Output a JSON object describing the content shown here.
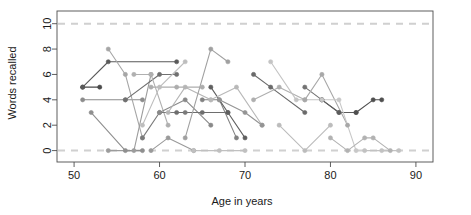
{
  "chart_data": {
    "type": "line",
    "title": "",
    "subtitle": "",
    "xlabel": "Age in years",
    "ylabel": "Words recalled",
    "xlim": [
      48,
      92
    ],
    "ylim": [
      -0.9,
      11.0
    ],
    "xticks": [
      50,
      60,
      70,
      80,
      90
    ],
    "yticks": [
      0,
      2,
      4,
      6,
      8,
      10
    ],
    "grid": false,
    "legend": null,
    "legend_position": "none",
    "annotations": [
      {
        "type": "hline",
        "y": 10,
        "style": "dashed",
        "color": "#d0d0d0",
        "label": "ceiling at 10 words"
      },
      {
        "type": "hline",
        "y": 0,
        "style": "dashed",
        "color": "#d0d0d0",
        "label": "floor at 0 words"
      }
    ],
    "marker": "filled-circle",
    "series": [
      {
        "name": "p01",
        "color": "#4a4a4a",
        "x": [
          51,
          53
        ],
        "values": [
          5,
          5
        ]
      },
      {
        "name": "p02",
        "color": "#5a5a5a",
        "x": [
          51,
          54,
          62
        ],
        "values": [
          5,
          7,
          7
        ]
      },
      {
        "name": "p03",
        "color": "#8c8c8c",
        "x": [
          51,
          56,
          58
        ],
        "values": [
          4,
          4,
          4
        ]
      },
      {
        "name": "p04",
        "color": "#a6a6a6",
        "x": [
          54,
          56,
          58
        ],
        "values": [
          8,
          6,
          1
        ]
      },
      {
        "name": "p05",
        "color": "#9c9c9c",
        "x": [
          54,
          57,
          59
        ],
        "values": [
          0,
          0,
          6
        ]
      },
      {
        "name": "p06",
        "color": "#8f8f8f",
        "x": [
          52,
          56,
          58
        ],
        "values": [
          3,
          0,
          0
        ]
      },
      {
        "name": "p07",
        "color": "#707070",
        "x": [
          56,
          60,
          62
        ],
        "values": [
          4,
          6,
          6
        ]
      },
      {
        "name": "p08",
        "color": "#b0b0b0",
        "x": [
          57,
          59,
          61
        ],
        "values": [
          6,
          6,
          2
        ]
      },
      {
        "name": "p09",
        "color": "#bdbdbd",
        "x": [
          58,
          60,
          63
        ],
        "values": [
          2,
          5,
          7
        ]
      },
      {
        "name": "p10",
        "color": "#7a7a7a",
        "x": [
          58,
          60,
          63
        ],
        "values": [
          1,
          3,
          3
        ]
      },
      {
        "name": "p11",
        "color": "#9a9a9a",
        "x": [
          59,
          61,
          64
        ],
        "values": [
          0,
          1,
          0
        ]
      },
      {
        "name": "p12",
        "color": "#adadad",
        "x": [
          59,
          62,
          65
        ],
        "values": [
          5,
          5,
          5
        ]
      },
      {
        "name": "p13",
        "color": "#898989",
        "x": [
          60,
          63,
          66
        ],
        "values": [
          3,
          4,
          2
        ]
      },
      {
        "name": "p14",
        "color": "#b5b5b5",
        "x": [
          61,
          63,
          66
        ],
        "values": [
          3,
          5,
          4
        ]
      },
      {
        "name": "p15",
        "color": "#6e6e6e",
        "x": [
          62,
          65,
          68
        ],
        "values": [
          3,
          3,
          3
        ]
      },
      {
        "name": "p16",
        "color": "#a0a0a0",
        "x": [
          63,
          66,
          68
        ],
        "values": [
          1,
          8,
          7
        ]
      },
      {
        "name": "p17",
        "color": "#c0c0c0",
        "x": [
          64,
          67,
          70
        ],
        "values": [
          0,
          0,
          0
        ]
      },
      {
        "name": "p18",
        "color": "#828282",
        "x": [
          65,
          67,
          69
        ],
        "values": [
          4,
          4,
          1
        ]
      },
      {
        "name": "p19",
        "color": "#5f5f5f",
        "x": [
          66,
          68,
          70
        ],
        "values": [
          5,
          3,
          1
        ]
      },
      {
        "name": "p20",
        "color": "#b8b8b8",
        "x": [
          66,
          69,
          72
        ],
        "values": [
          4,
          5,
          2
        ]
      },
      {
        "name": "p21",
        "color": "#949494",
        "x": [
          67,
          70,
          72
        ],
        "values": [
          4,
          3,
          2
        ]
      },
      {
        "name": "p22",
        "color": "#6a6a6a",
        "x": [
          71,
          73,
          77
        ],
        "values": [
          6,
          5,
          3
        ]
      },
      {
        "name": "p23",
        "color": "#afafaf",
        "x": [
          71,
          74,
          77
        ],
        "values": [
          4,
          5,
          4
        ]
      },
      {
        "name": "p24",
        "color": "#c4c4c4",
        "x": [
          73,
          76,
          79
        ],
        "values": [
          7,
          4,
          4
        ]
      },
      {
        "name": "p25",
        "color": "#bcbcbc",
        "x": [
          74,
          77,
          80
        ],
        "values": [
          2,
          0,
          2
        ]
      },
      {
        "name": "p26",
        "color": "#737373",
        "x": [
          77,
          79,
          81
        ],
        "values": [
          5,
          4,
          3
        ]
      },
      {
        "name": "p27",
        "color": "#5c5c5c",
        "x": [
          79,
          81,
          83
        ],
        "values": [
          4,
          3,
          3
        ]
      },
      {
        "name": "p28",
        "color": "#a8a8a8",
        "x": [
          77,
          79,
          82
        ],
        "values": [
          4,
          6,
          2
        ]
      },
      {
        "name": "p29",
        "color": "#c8c8c8",
        "x": [
          79,
          81,
          83
        ],
        "values": [
          4,
          4,
          0
        ]
      },
      {
        "name": "p30",
        "color": "#4f4f4f",
        "x": [
          83,
          85,
          86
        ],
        "values": [
          3,
          4,
          4
        ]
      },
      {
        "name": "p31",
        "color": "#b2b2b2",
        "x": [
          80,
          82,
          84,
          85,
          87
        ],
        "values": [
          1,
          0,
          1,
          1,
          0
        ]
      },
      {
        "name": "p32",
        "color": "#c2c2c2",
        "x": [
          84,
          86,
          88
        ],
        "values": [
          0,
          0,
          0
        ]
      }
    ]
  },
  "axes": {
    "y_label": "Words recalled",
    "x_label": "Age in years",
    "x_tick_labels": [
      "50",
      "60",
      "70",
      "80",
      "90"
    ],
    "y_tick_labels": [
      "0",
      "2",
      "4",
      "6",
      "8",
      "10"
    ]
  },
  "style": {
    "background": "#ffffff",
    "axis_color": "#4d4d4d",
    "reference_line_color": "#d6d6d6",
    "text_color": "#1a1a1a"
  }
}
